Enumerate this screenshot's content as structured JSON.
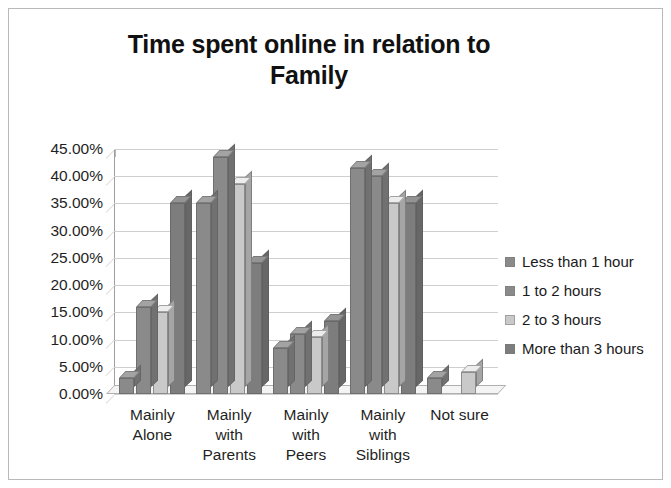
{
  "chart_data": {
    "type": "bar",
    "title": "Time spent online in relation to Family",
    "title_lines": [
      "Time spent online in relation to",
      "Family"
    ],
    "xlabel": "",
    "ylabel": "",
    "ylim": [
      0,
      45
    ],
    "grid": true,
    "legend_position": "right",
    "y_ticks": [
      "0.00%",
      "5.00%",
      "10.00%",
      "15.00%",
      "20.00%",
      "25.00%",
      "30.00%",
      "35.00%",
      "40.00%",
      "45.00%"
    ],
    "y_tick_values": [
      0,
      5,
      10,
      15,
      20,
      25,
      30,
      35,
      40,
      45
    ],
    "categories": [
      "Mainly Alone",
      "Mainly with Parents",
      "Mainly with Peers",
      "Mainly with Siblings",
      "Not sure"
    ],
    "category_lines": [
      [
        "Mainly",
        "Alone"
      ],
      [
        "Mainly",
        "with",
        "Parents"
      ],
      [
        "Mainly",
        "with",
        "Peers"
      ],
      [
        "Mainly",
        "with",
        "Siblings"
      ],
      [
        "Not sure"
      ]
    ],
    "series": [
      {
        "name": "Less than 1 hour",
        "color": "#8a8a8a",
        "values": [
          3.0,
          35.0,
          8.5,
          41.5,
          3.0
        ]
      },
      {
        "name": "1 to 2 hours",
        "color": "#8a8a8a",
        "values": [
          16.0,
          43.5,
          11.0,
          40.0,
          0.0
        ]
      },
      {
        "name": "2 to 3 hours",
        "color": "#c9c9c9",
        "values": [
          15.0,
          38.5,
          10.5,
          35.0,
          4.0
        ]
      },
      {
        "name": "More than 3 hours",
        "color": "#7d7d7d",
        "values": [
          35.0,
          24.0,
          13.5,
          35.0,
          0.0
        ]
      }
    ]
  }
}
